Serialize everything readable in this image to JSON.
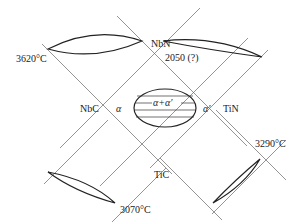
{
  "diagram": {
    "type": "quasi-binary phase diagram square (reciprocal system)",
    "compounds": {
      "top": "NbN",
      "left": "NbC",
      "right": "TiN",
      "bottom": "TiC"
    },
    "temperatures": {
      "nbc_nbn_edge": "3620°C",
      "nbn_tin_edge": "2050 (?)",
      "nbc_tic_edge": "3070°C",
      "tin_tic_edge": "3290°C"
    },
    "phases": {
      "left": "α",
      "right": "α′",
      "center": "α+α′"
    },
    "colors": {
      "line": "#555555",
      "curve": "#222222"
    }
  }
}
